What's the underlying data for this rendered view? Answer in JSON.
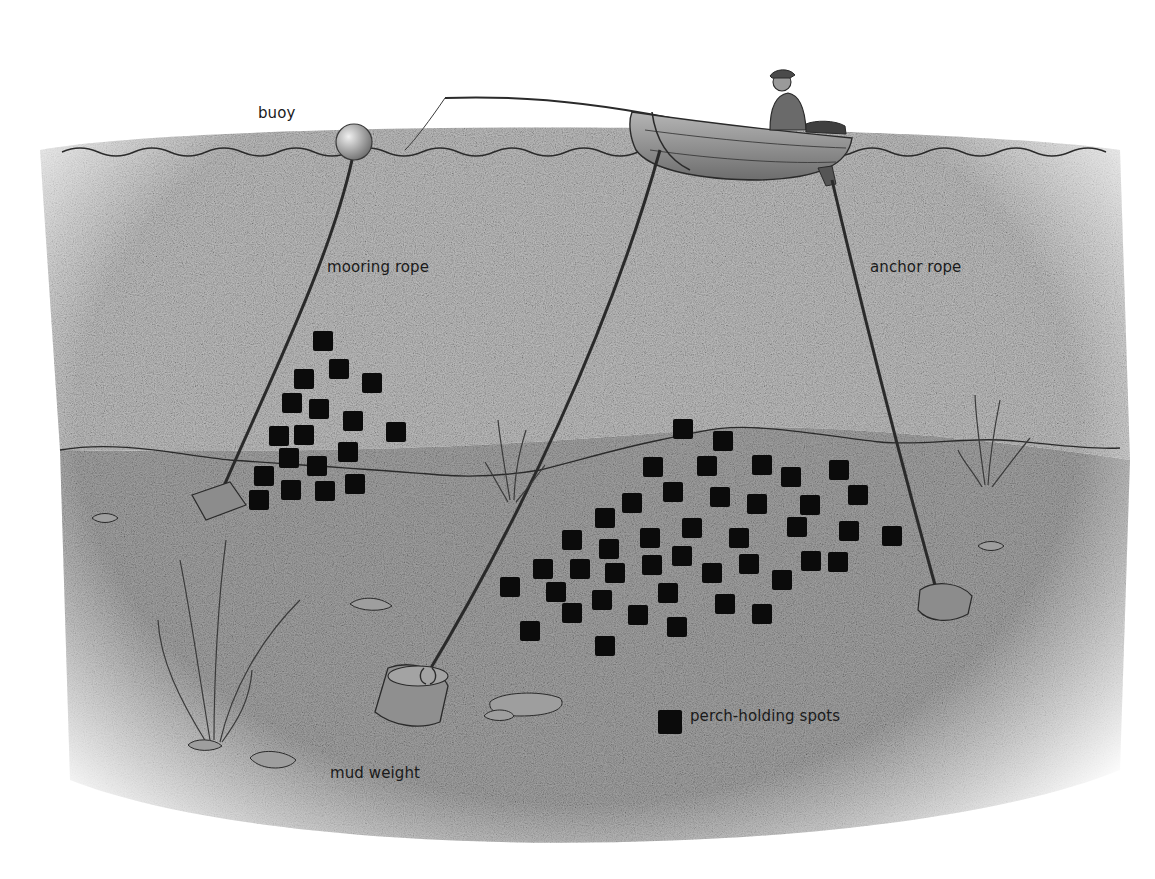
{
  "diagram": {
    "labels": {
      "buoy": "buoy",
      "mooring_rope": "mooring rope",
      "anchor_rope": "anchor rope",
      "mud_weight": "mud weight",
      "legend": "perch-holding spots"
    },
    "colors": {
      "spot": "#0b0b0b",
      "water_texture": "#b8b8b8",
      "seabed_texture": "#9a9a9a",
      "line": "#2a2a2a",
      "boat": "#8a8a8a"
    },
    "elements": [
      "water-surface",
      "buoy",
      "mooring-rope",
      "mooring-block",
      "boat",
      "angler",
      "fishing-rod",
      "front-rope",
      "mud-weight",
      "anchor-rope",
      "anchor-stone",
      "weed-clumps",
      "stones",
      "seabed-ridge",
      "perch-spots"
    ],
    "spots_left": [
      [
        323,
        341
      ],
      [
        339,
        369
      ],
      [
        304,
        379
      ],
      [
        372,
        383
      ],
      [
        292,
        403
      ],
      [
        319,
        409
      ],
      [
        353,
        421
      ],
      [
        396,
        432
      ],
      [
        279,
        436
      ],
      [
        304,
        435
      ],
      [
        348,
        452
      ],
      [
        289,
        458
      ],
      [
        317,
        466
      ],
      [
        264,
        476
      ],
      [
        355,
        484
      ],
      [
        291,
        490
      ],
      [
        325,
        491
      ],
      [
        259,
        500
      ]
    ],
    "spots_right": [
      [
        683,
        429
      ],
      [
        723,
        441
      ],
      [
        653,
        467
      ],
      [
        707,
        466
      ],
      [
        762,
        465
      ],
      [
        839,
        470
      ],
      [
        791,
        477
      ],
      [
        673,
        492
      ],
      [
        720,
        497
      ],
      [
        757,
        504
      ],
      [
        810,
        505
      ],
      [
        858,
        495
      ],
      [
        632,
        503
      ],
      [
        605,
        518
      ],
      [
        692,
        528
      ],
      [
        797,
        527
      ],
      [
        849,
        531
      ],
      [
        892,
        536
      ],
      [
        650,
        538
      ],
      [
        739,
        538
      ],
      [
        572,
        540
      ],
      [
        609,
        549
      ],
      [
        682,
        556
      ],
      [
        652,
        565
      ],
      [
        749,
        564
      ],
      [
        811,
        561
      ],
      [
        838,
        562
      ],
      [
        543,
        569
      ],
      [
        580,
        569
      ],
      [
        615,
        573
      ],
      [
        712,
        573
      ],
      [
        782,
        580
      ],
      [
        510,
        587
      ],
      [
        556,
        592
      ],
      [
        602,
        600
      ],
      [
        668,
        593
      ],
      [
        725,
        604
      ],
      [
        572,
        613
      ],
      [
        638,
        615
      ],
      [
        762,
        614
      ],
      [
        530,
        631
      ],
      [
        677,
        627
      ],
      [
        605,
        646
      ]
    ]
  }
}
